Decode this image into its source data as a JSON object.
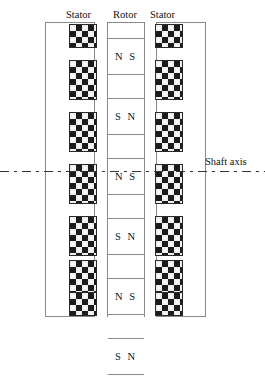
{
  "diagram": {
    "labels": {
      "stator_left": "Stator",
      "rotor": "Rotor",
      "stator_right": "Stator",
      "shaft_axis": "Shaft axis"
    },
    "colors": {
      "frame_line": "#8a8a8a",
      "block_dark": "#1c1c1c",
      "block_light": "#efefef",
      "axis_line": "#333333",
      "text": "#111111",
      "background": "#ffffff"
    },
    "rotor": {
      "cells": [
        {
          "label": "",
          "height": 16,
          "type": "spacer"
        },
        {
          "label": "N S",
          "height": 36,
          "type": "magnet"
        },
        {
          "label": "",
          "height": 24,
          "type": "spacer"
        },
        {
          "label": "S N",
          "height": 36,
          "type": "magnet"
        },
        {
          "label": "",
          "height": 24,
          "type": "spacer"
        },
        {
          "label": "N S",
          "height": 36,
          "type": "magnet"
        },
        {
          "label": "",
          "height": 24,
          "type": "spacer"
        },
        {
          "label": "S N",
          "height": 36,
          "type": "magnet"
        },
        {
          "label": "",
          "height": 24,
          "type": "spacer"
        },
        {
          "label": "N S",
          "height": 36,
          "type": "magnet"
        },
        {
          "label": "",
          "height": 24,
          "type": "spacer"
        },
        {
          "label": "S N",
          "height": 36,
          "type": "magnet"
        },
        {
          "label": "",
          "height": 17,
          "type": "spacer"
        }
      ]
    },
    "stator_left": {
      "frame": {
        "x": 45,
        "y": 22,
        "width": 50,
        "height": 295
      },
      "blocks": [
        {
          "x": 69,
          "y": 24,
          "width": 28,
          "height": 24
        },
        {
          "x": 69,
          "y": 60,
          "width": 28,
          "height": 40
        },
        {
          "x": 69,
          "y": 112,
          "width": 28,
          "height": 40
        },
        {
          "x": 69,
          "y": 164,
          "width": 28,
          "height": 40
        },
        {
          "x": 69,
          "y": 216,
          "width": 28,
          "height": 40
        },
        {
          "x": 69,
          "y": 260,
          "width": 28,
          "height": 40
        },
        {
          "x": 69,
          "y": 292,
          "width": 28,
          "height": 24
        }
      ]
    },
    "stator_right": {
      "frame": {
        "x": 156,
        "y": 22,
        "width": 50,
        "height": 295
      },
      "blocks": [
        {
          "x": 155,
          "y": 24,
          "width": 28,
          "height": 24
        },
        {
          "x": 155,
          "y": 60,
          "width": 28,
          "height": 40
        },
        {
          "x": 155,
          "y": 112,
          "width": 28,
          "height": 40
        },
        {
          "x": 155,
          "y": 164,
          "width": 28,
          "height": 40
        },
        {
          "x": 155,
          "y": 216,
          "width": 28,
          "height": 40
        },
        {
          "x": 155,
          "y": 260,
          "width": 28,
          "height": 40
        },
        {
          "x": 155,
          "y": 292,
          "width": 28,
          "height": 24
        }
      ]
    },
    "shaft_axis": {
      "y": 171,
      "x_start": 0,
      "x_end": 265,
      "style": "dash-dot"
    }
  }
}
